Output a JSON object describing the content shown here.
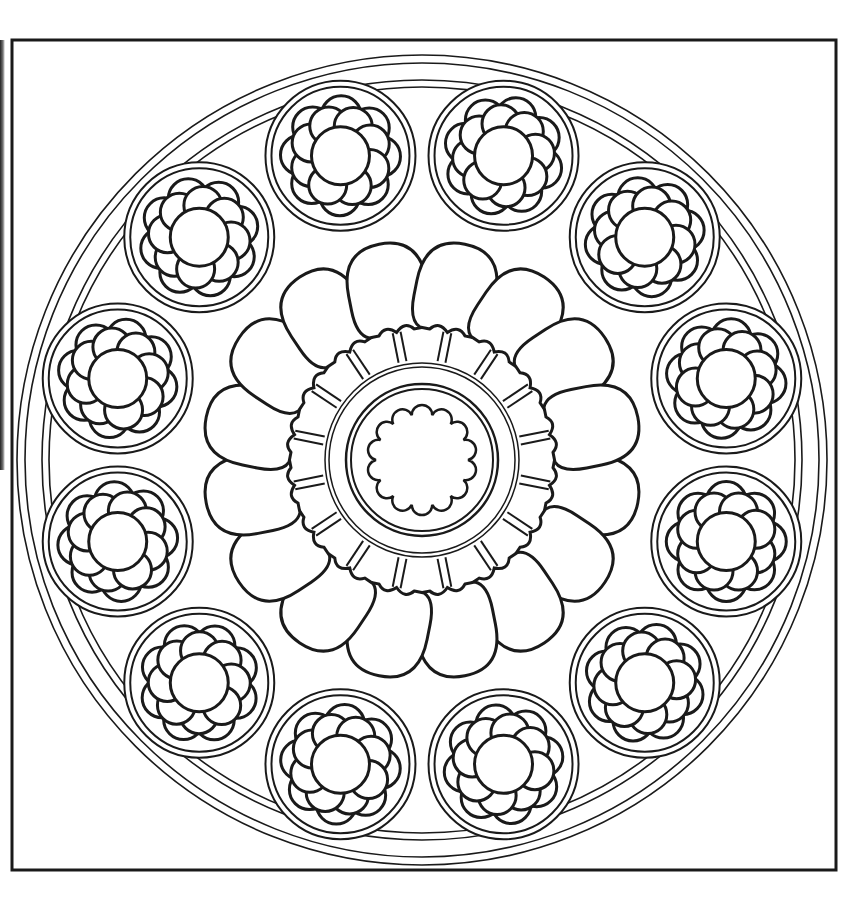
{
  "page": {
    "background": "#ffffff",
    "ink": "#1a1a1a"
  },
  "frame": {
    "x": 12,
    "y": 40,
    "width": 824,
    "height": 830
  },
  "rose_window": {
    "center": [
      422,
      460
    ],
    "outer_rings": [
      405,
      397,
      380,
      373
    ],
    "medallion_count": 12,
    "medallion_ring_radius": 315,
    "medallion_outer_radii": [
      75,
      69,
      63
    ],
    "medallion_start_angle_deg": 15,
    "flower_petal_count": 8,
    "flower_center_radius": 29,
    "lobe_count": 16,
    "hub_rings": [
      97,
      93,
      76,
      71
    ],
    "hub_flower_lobes": 14
  }
}
